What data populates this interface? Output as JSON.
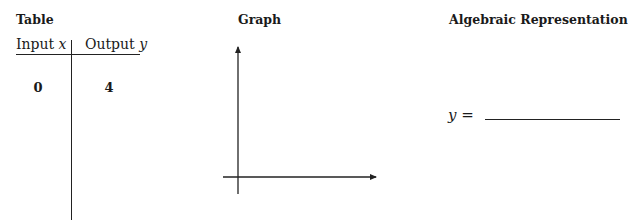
{
  "sections": {
    "table": {
      "heading": "Table",
      "columns": [
        "Input x",
        "Output y"
      ],
      "column_parts": [
        {
          "word": "Input",
          "var": "x"
        },
        {
          "word": "Output",
          "var": "y"
        }
      ],
      "rows": [
        {
          "x": "0",
          "y": "4"
        }
      ]
    },
    "graph": {
      "heading": "Graph",
      "axes": {
        "x_arrow": true,
        "y_arrow": true
      }
    },
    "algebraic": {
      "heading": "Algebraic Representation",
      "lhs": "y",
      "equals": "="
    }
  },
  "colors": {
    "text": "#1a1a1a",
    "lines": "#222222",
    "background": "#ffffff"
  }
}
